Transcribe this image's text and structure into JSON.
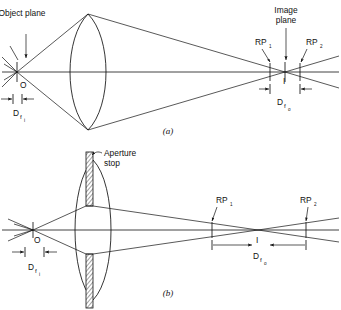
{
  "figure": {
    "title_note": "Depth of field and depth of focus diagram",
    "background_color": "#ffffff",
    "ink_color": "#111111"
  },
  "panels": [
    {
      "id": "a",
      "label": "(a)",
      "caption_note": "Lens without aperture stop",
      "labels": {
        "object_plane": "Object plane",
        "image_plane": "Image plane",
        "object_point": "O",
        "image_point": "I",
        "rp1": "RP",
        "rp1_sub": "1",
        "rp2": "RP",
        "rp2_sub": "2",
        "depth_field_main": "D",
        "depth_field_sub": "f",
        "depth_field_subsub": "i",
        "depth_focus_main": "D",
        "depth_focus_sub": "f",
        "depth_focus_subsub": "o"
      }
    },
    {
      "id": "b",
      "label": "(b)",
      "caption_note": "Lens with aperture stop",
      "labels": {
        "aperture_stop_line1": "Aperture",
        "aperture_stop_line2": "stop",
        "object_point": "O",
        "image_point": "I",
        "rp1": "RP",
        "rp1_sub": "1",
        "rp2": "RP",
        "rp2_sub": "2",
        "depth_field_main": "D",
        "depth_field_sub": "f",
        "depth_field_subsub": "i",
        "depth_focus_main": "D",
        "depth_focus_sub": "f",
        "depth_focus_subsub": "o"
      }
    }
  ]
}
